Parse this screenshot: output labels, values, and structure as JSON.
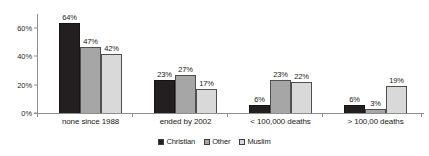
{
  "chart_data": {
    "type": "bar",
    "title": "",
    "xlabel": "",
    "ylabel": "",
    "ylim": [
      0,
      70
    ],
    "grid": false,
    "legend_position": "bottom-center",
    "categories": [
      "none since 1988",
      "ended by 2002",
      "< 100,000 deaths",
      "> 100,00 deaths"
    ],
    "ytick_labels": [
      "0%",
      "20%",
      "40%",
      "60%"
    ],
    "ytick_values": [
      0,
      20,
      40,
      60
    ],
    "series": [
      {
        "name": "Christian",
        "color": "#231f20",
        "values": [
          64,
          23,
          6,
          6
        ],
        "labels": [
          "64%",
          "23%",
          "6%",
          "6%"
        ]
      },
      {
        "name": "Other",
        "color": "#a6a6a6",
        "values": [
          47,
          27,
          23,
          3
        ],
        "labels": [
          "47%",
          "27%",
          "23%",
          "3%"
        ]
      },
      {
        "name": "Muslim",
        "color": "#d9d9d9",
        "values": [
          42,
          17,
          22,
          19
        ],
        "labels": [
          "42%",
          "17%",
          "22%",
          "19%"
        ]
      }
    ]
  },
  "legend": {
    "items": [
      {
        "label": "Christian"
      },
      {
        "label": "Other"
      },
      {
        "label": "Muslim"
      }
    ]
  }
}
